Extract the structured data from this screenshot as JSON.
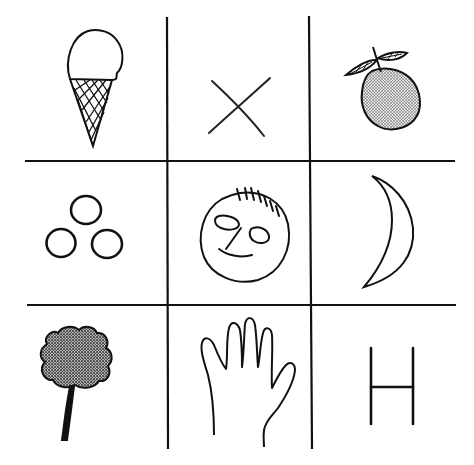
{
  "diagram": {
    "type": "3x3 picture grid",
    "colors": {
      "ink": "#111111",
      "background": "#ffffff",
      "stipple": "#9a9a9a"
    },
    "cells": [
      {
        "row": 0,
        "col": 0,
        "icon": "ice-cream-cone-icon",
        "label": "ice cream cone"
      },
      {
        "row": 0,
        "col": 1,
        "icon": "x-cross-icon",
        "label": "X"
      },
      {
        "row": 0,
        "col": 2,
        "icon": "apple-icon",
        "label": "apple"
      },
      {
        "row": 1,
        "col": 0,
        "icon": "three-circles-icon",
        "label": "three circles"
      },
      {
        "row": 1,
        "col": 1,
        "icon": "smiley-face-icon",
        "label": "face"
      },
      {
        "row": 1,
        "col": 2,
        "icon": "crescent-moon-icon",
        "label": "crescent moon"
      },
      {
        "row": 2,
        "col": 0,
        "icon": "tree-icon",
        "label": "tree"
      },
      {
        "row": 2,
        "col": 1,
        "icon": "hand-icon",
        "label": "hand"
      },
      {
        "row": 2,
        "col": 2,
        "icon": "letter-h-icon",
        "label": "H"
      }
    ]
  }
}
